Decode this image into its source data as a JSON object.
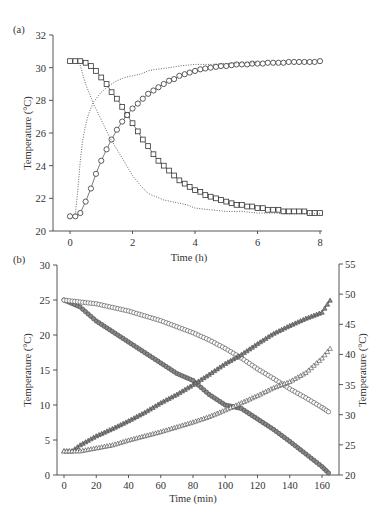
{
  "chart_data": [
    {
      "panel": "(a)",
      "type": "line",
      "title": "",
      "xlabel": "Time (h)",
      "ylabel": "Temperature (°C)",
      "xlim": [
        0,
        8
      ],
      "ylim": [
        20,
        32
      ],
      "xticks": [
        0,
        2,
        4,
        6,
        8
      ],
      "yticks": [
        20,
        22,
        24,
        26,
        28,
        30,
        32
      ],
      "grid": false,
      "legend": null,
      "series": [
        {
          "name": "squares (cooling)",
          "marker": "square",
          "line": "solid",
          "x": [
            0,
            0.17,
            0.33,
            0.5,
            0.67,
            0.83,
            1.0,
            1.17,
            1.33,
            1.5,
            1.67,
            1.83,
            2.0,
            2.17,
            2.33,
            2.5,
            2.67,
            2.83,
            3.0,
            3.17,
            3.33,
            3.5,
            3.67,
            3.83,
            4.0,
            4.17,
            4.33,
            4.5,
            4.67,
            4.83,
            5.0,
            5.17,
            5.33,
            5.5,
            5.67,
            5.83,
            6.0,
            6.17,
            6.33,
            6.5,
            6.67,
            6.83,
            7.0,
            7.17,
            7.33,
            7.5,
            7.67,
            7.83,
            8.0
          ],
          "y": [
            30.4,
            30.4,
            30.4,
            30.3,
            30.1,
            29.8,
            29.4,
            29.0,
            28.5,
            28.1,
            27.6,
            27.1,
            26.6,
            26.1,
            25.6,
            25.2,
            24.7,
            24.3,
            24.0,
            23.7,
            23.4,
            23.1,
            22.9,
            22.7,
            22.5,
            22.4,
            22.2,
            22.1,
            22.0,
            21.9,
            21.8,
            21.7,
            21.6,
            21.6,
            21.5,
            21.5,
            21.4,
            21.4,
            21.3,
            21.3,
            21.3,
            21.2,
            21.2,
            21.2,
            21.2,
            21.2,
            21.1,
            21.1,
            21.1
          ]
        },
        {
          "name": "circles (heating)",
          "marker": "circle",
          "line": "solid",
          "x": [
            0,
            0.17,
            0.33,
            0.5,
            0.67,
            0.83,
            1.0,
            1.17,
            1.33,
            1.5,
            1.67,
            1.83,
            2.0,
            2.17,
            2.33,
            2.5,
            2.67,
            2.83,
            3.0,
            3.17,
            3.33,
            3.5,
            3.67,
            3.83,
            4.0,
            4.17,
            4.33,
            4.5,
            4.67,
            4.83,
            5.0,
            5.17,
            5.33,
            5.5,
            5.67,
            5.83,
            6.0,
            6.17,
            6.33,
            6.5,
            6.67,
            6.83,
            7.0,
            7.17,
            7.33,
            7.5,
            7.67,
            7.83,
            8.0
          ],
          "y": [
            20.9,
            20.9,
            21.1,
            21.8,
            22.6,
            23.5,
            24.3,
            25.0,
            25.6,
            26.2,
            26.7,
            27.1,
            27.5,
            27.8,
            28.1,
            28.4,
            28.6,
            28.8,
            29.0,
            29.2,
            29.3,
            29.5,
            29.6,
            29.7,
            29.8,
            29.9,
            29.95,
            30.0,
            30.05,
            30.1,
            30.1,
            30.15,
            30.2,
            30.2,
            30.2,
            30.25,
            30.25,
            30.25,
            30.3,
            30.3,
            30.3,
            30.3,
            30.35,
            30.35,
            30.35,
            30.35,
            30.35,
            30.35,
            30.4
          ]
        },
        {
          "name": "dotted (heating reference)",
          "marker": "none",
          "line": "dotted",
          "x": [
            0.17,
            0.25,
            0.33,
            0.4,
            0.5,
            0.6,
            0.75,
            1.0,
            1.25,
            1.5,
            1.75,
            2.0,
            2.25,
            2.5,
            2.75,
            3.0,
            3.5,
            4.0,
            4.5,
            5.0,
            5.5,
            6.0
          ],
          "y": [
            21.0,
            22.5,
            24.3,
            25.5,
            26.5,
            27.2,
            27.9,
            28.5,
            28.9,
            29.2,
            29.4,
            29.5,
            29.6,
            29.8,
            29.9,
            29.95,
            30.1,
            30.2,
            30.2,
            30.25,
            30.3,
            30.3
          ]
        },
        {
          "name": "dotted (cooling reference)",
          "marker": "none",
          "line": "dotted",
          "x": [
            0.3,
            0.5,
            0.75,
            1.0,
            1.25,
            1.5,
            1.75,
            2.0,
            2.25,
            2.5,
            2.75,
            3.0,
            3.25,
            3.5,
            3.75,
            4.0,
            4.5,
            5.0,
            5.5,
            6.0,
            6.5,
            7.0,
            7.5,
            8.0
          ],
          "y": [
            30.3,
            29.0,
            27.8,
            26.8,
            25.8,
            25.0,
            24.2,
            23.4,
            22.8,
            22.3,
            22.1,
            21.9,
            21.8,
            21.7,
            21.6,
            21.4,
            21.3,
            21.2,
            21.2,
            21.1,
            21.1,
            21.05,
            21.05,
            21.05
          ]
        }
      ]
    },
    {
      "panel": "(b)",
      "type": "line",
      "title": "",
      "xlabel": "Time (min)",
      "ylabel": "Temperature (°C)",
      "ylabel_right": "Temperature (°C)",
      "xlim": [
        0,
        170
      ],
      "ylim": [
        0,
        30
      ],
      "ylim_right": [
        20,
        55
      ],
      "xticks": [
        0,
        20,
        40,
        60,
        80,
        100,
        120,
        140,
        160
      ],
      "yticks": [
        0,
        5,
        10,
        15,
        20,
        25,
        30
      ],
      "yticks_right": [
        20,
        25,
        30,
        35,
        40,
        45,
        50,
        55
      ],
      "grid": false,
      "legend": null,
      "series": [
        {
          "name": "left axis fast cooling",
          "axis": "left",
          "marker": "circle-filled",
          "x": [
            0,
            10,
            20,
            30,
            40,
            50,
            60,
            70,
            80,
            85,
            90,
            100,
            110,
            120,
            130,
            140,
            150,
            160,
            164
          ],
          "y": [
            25.0,
            24.0,
            22.0,
            20.5,
            19.0,
            17.5,
            16.0,
            14.5,
            13.5,
            12.5,
            11.5,
            10.0,
            9.5,
            8.0,
            6.5,
            4.8,
            3.0,
            1.2,
            0.3
          ]
        },
        {
          "name": "right axis slow cooling",
          "axis": "right",
          "marker": "circle-open",
          "x": [
            0,
            10,
            20,
            30,
            40,
            50,
            60,
            70,
            80,
            90,
            100,
            110,
            120,
            130,
            140,
            150,
            160,
            164
          ],
          "y": [
            49.0,
            48.7,
            48.4,
            47.8,
            47.2,
            46.4,
            45.6,
            44.6,
            43.6,
            42.4,
            41.0,
            39.4,
            37.6,
            36.0,
            34.3,
            32.8,
            31.2,
            30.5
          ]
        },
        {
          "name": "right axis fast heating",
          "axis": "right",
          "marker": "triangle-filled",
          "x": [
            0,
            5,
            10,
            20,
            30,
            40,
            50,
            60,
            70,
            80,
            90,
            100,
            110,
            120,
            130,
            140,
            150,
            160,
            165
          ],
          "y": [
            24.0,
            24.0,
            25.0,
            26.5,
            27.7,
            29.0,
            30.4,
            32.0,
            33.4,
            35.0,
            36.7,
            38.5,
            40.0,
            41.8,
            43.5,
            44.8,
            46.0,
            47.0,
            49.0
          ]
        },
        {
          "name": "right axis slow heating",
          "axis": "right",
          "marker": "triangle-open",
          "x": [
            0,
            10,
            20,
            30,
            40,
            50,
            60,
            70,
            80,
            90,
            100,
            110,
            120,
            130,
            140,
            150,
            160,
            165
          ],
          "y": [
            24.0,
            24.0,
            24.5,
            25.0,
            25.8,
            26.5,
            27.2,
            28.0,
            28.8,
            29.7,
            30.8,
            32.0,
            33.2,
            34.5,
            35.5,
            37.0,
            39.4,
            41.0
          ]
        }
      ]
    }
  ],
  "labels": {
    "panel_a": "(a)",
    "panel_b": "(b)",
    "a_xlabel": "Time (h)",
    "a_ylabel": "Temperature (°C)",
    "b_xlabel": "Time (min)",
    "b_ylabel_left": "Temperature (°C)",
    "b_ylabel_right": "Temperature (°C)"
  }
}
